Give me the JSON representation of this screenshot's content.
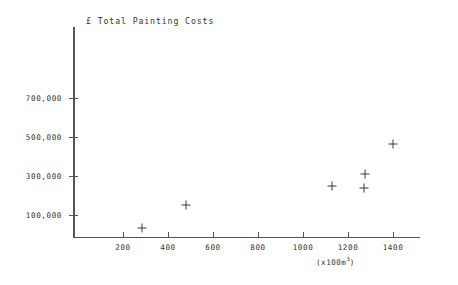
{
  "chart_data": {
    "type": "scatter",
    "title": "£ Total Painting Costs",
    "xlabel": "(x100m³)",
    "ylabel": "£ Total Painting Costs",
    "xlim": [
      0,
      1480
    ],
    "ylim": [
      0,
      800000
    ],
    "grid": false,
    "legend": "none",
    "x_unit_prefix": "(x100m",
    "x_unit_exponent": "3",
    "x_unit_suffix": ")",
    "x_ticks": [
      200,
      400,
      600,
      800,
      1000,
      1200,
      1400
    ],
    "x_tick_labels": [
      "200",
      "400",
      "600",
      "800",
      "1000",
      "1200",
      "1400"
    ],
    "y_ticks": [
      100000,
      300000,
      500000,
      700000
    ],
    "y_tick_labels": [
      "100,000",
      "300,000",
      "500,000",
      "700,000"
    ],
    "series": [
      {
        "name": "Painting contracts",
        "marker": "plus",
        "color": "#3a3a3a",
        "points": [
          {
            "x": 285,
            "y": 30000
          },
          {
            "x": 480,
            "y": 150000
          },
          {
            "x": 1130,
            "y": 245000
          },
          {
            "x": 1270,
            "y": 235000
          },
          {
            "x": 1275,
            "y": 310000
          },
          {
            "x": 1400,
            "y": 460000
          }
        ]
      }
    ]
  },
  "axes": {
    "y_axis_name": "y-axis",
    "x_axis_name": "x-axis"
  }
}
